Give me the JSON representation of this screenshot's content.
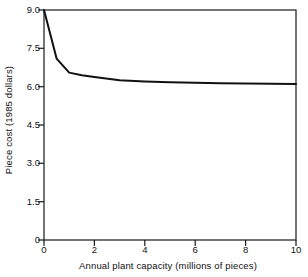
{
  "chart_data": {
    "type": "line",
    "title": "",
    "xlabel": "Annual plant capacity (millions of pieces)",
    "ylabel": "Piece cost (1985 dollars)",
    "xlim": [
      0,
      10
    ],
    "ylim": [
      0,
      9.0
    ],
    "xticks": [
      "0",
      "2",
      "4",
      "6",
      "8",
      "10"
    ],
    "xtick_values": [
      0,
      2,
      4,
      6,
      8,
      10
    ],
    "yticks": [
      "0",
      "1.5",
      "3.0",
      "4.5",
      "6.0",
      "7.5",
      "9.0"
    ],
    "ytick_values": [
      0,
      1.5,
      3.0,
      4.5,
      6.0,
      7.5,
      9.0
    ],
    "grid": false,
    "legend": null,
    "series": [
      {
        "name": "Piece cost",
        "color": "#111111",
        "x": [
          0.0,
          0.5,
          1.0,
          1.5,
          2.0,
          3.0,
          4.0,
          5.0,
          6.0,
          7.0,
          8.0,
          9.0,
          10.0
        ],
        "y": [
          9.0,
          7.1,
          6.55,
          6.45,
          6.38,
          6.25,
          6.2,
          6.17,
          6.15,
          6.13,
          6.12,
          6.11,
          6.1
        ]
      }
    ],
    "annotations": []
  },
  "axes": {
    "frame": "box",
    "tick_direction": "out"
  }
}
